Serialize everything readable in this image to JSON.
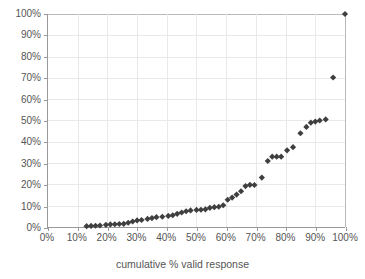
{
  "chart_data": {
    "type": "scatter",
    "title": "",
    "xlabel": "cumulative % valid response",
    "ylabel": "",
    "xlim": [
      0,
      100
    ],
    "ylim": [
      0,
      100
    ],
    "xticks": [
      "0%",
      "10%",
      "20%",
      "30%",
      "40%",
      "50%",
      "60%",
      "70%",
      "80%",
      "90%",
      "100%"
    ],
    "yticks": [
      "0%",
      "10%",
      "20%",
      "30%",
      "40%",
      "50%",
      "60%",
      "70%",
      "80%",
      "90%",
      "100%"
    ],
    "xtick_values": [
      0,
      10,
      20,
      30,
      40,
      50,
      60,
      70,
      80,
      90,
      100
    ],
    "ytick_values": [
      0,
      10,
      20,
      30,
      40,
      50,
      60,
      70,
      80,
      90,
      100
    ],
    "grid": true,
    "legend": false,
    "marker": "diamond",
    "marker_color": "#3f3f3f",
    "series": [
      {
        "name": "cumulative response",
        "points": [
          [
            13.0,
            0.4
          ],
          [
            14.5,
            0.5
          ],
          [
            16.0,
            0.6
          ],
          [
            17.5,
            0.7
          ],
          [
            19.5,
            1.0
          ],
          [
            21.0,
            1.2
          ],
          [
            22.5,
            1.3
          ],
          [
            24.0,
            1.4
          ],
          [
            25.5,
            1.5
          ],
          [
            27.0,
            2.0
          ],
          [
            28.5,
            2.6
          ],
          [
            30.0,
            3.1
          ],
          [
            31.5,
            3.3
          ],
          [
            33.5,
            3.8
          ],
          [
            35.0,
            4.2
          ],
          [
            36.5,
            4.6
          ],
          [
            38.5,
            4.8
          ],
          [
            40.5,
            5.2
          ],
          [
            42.0,
            5.5
          ],
          [
            43.5,
            6.2
          ],
          [
            45.0,
            6.8
          ],
          [
            46.5,
            7.4
          ],
          [
            48.0,
            7.8
          ],
          [
            50.0,
            8.0
          ],
          [
            51.5,
            8.1
          ],
          [
            53.0,
            8.3
          ],
          [
            54.5,
            9.0
          ],
          [
            56.0,
            9.3
          ],
          [
            57.5,
            9.5
          ],
          [
            59.0,
            10.2
          ],
          [
            60.5,
            12.8
          ],
          [
            62.0,
            13.8
          ],
          [
            63.5,
            15.2
          ],
          [
            65.0,
            16.8
          ],
          [
            66.5,
            19.2
          ],
          [
            68.0,
            19.8
          ],
          [
            69.5,
            19.7
          ],
          [
            72.0,
            23.2
          ],
          [
            74.0,
            31.0
          ],
          [
            75.5,
            33.0
          ],
          [
            77.0,
            33.0
          ],
          [
            78.5,
            33.0
          ],
          [
            80.5,
            36.0
          ],
          [
            82.5,
            37.5
          ],
          [
            85.0,
            44.0
          ],
          [
            87.0,
            47.0
          ],
          [
            88.5,
            49.0
          ],
          [
            90.0,
            49.5
          ],
          [
            91.5,
            50.0
          ],
          [
            93.5,
            50.5
          ],
          [
            96.0,
            70.2
          ],
          [
            100.0,
            100.0
          ]
        ]
      }
    ]
  },
  "axes": {
    "x_title": "cumulative % valid response"
  }
}
